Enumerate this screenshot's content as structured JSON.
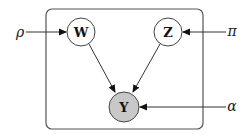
{
  "diagram": {
    "type": "graphical-model",
    "plate": {
      "x": 46,
      "y": 9,
      "width": 157,
      "height": 120,
      "radius": 6,
      "stroke": "#555555"
    },
    "nodes": [
      {
        "id": "W",
        "label": "W",
        "cx": 81,
        "cy": 32,
        "r": 14,
        "observed": false,
        "fill": "#ffffff"
      },
      {
        "id": "Z",
        "label": "Z",
        "cx": 168,
        "cy": 32,
        "r": 14,
        "observed": false,
        "fill": "#ffffff"
      },
      {
        "id": "Y",
        "label": "Y",
        "cx": 124,
        "cy": 107,
        "r": 15,
        "observed": true,
        "fill": "#c8c8c8"
      }
    ],
    "parameters": [
      {
        "id": "rho",
        "label": "ρ",
        "x": 20,
        "y": 32,
        "target": "W"
      },
      {
        "id": "pi",
        "label": "π",
        "x": 232,
        "y": 32,
        "target": "Z"
      },
      {
        "id": "alpha",
        "label": "α",
        "x": 232,
        "y": 107,
        "target": "Y"
      }
    ],
    "edges": [
      {
        "from": "rho",
        "to": "W"
      },
      {
        "from": "pi",
        "to": "Z"
      },
      {
        "from": "W",
        "to": "Y"
      },
      {
        "from": "Z",
        "to": "Y"
      },
      {
        "from": "alpha",
        "to": "Y"
      }
    ],
    "colors": {
      "line": "#333333",
      "node_stroke": "#444444",
      "observed_fill": "#c8c8c8",
      "latent_fill": "#ffffff"
    }
  }
}
